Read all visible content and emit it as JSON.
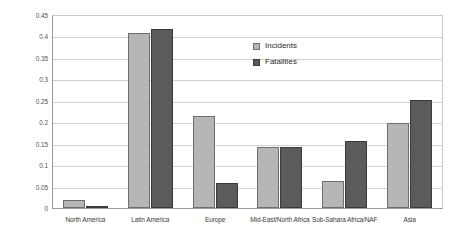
{
  "chart_data": {
    "type": "bar",
    "title": "",
    "subtitle": "",
    "xlabel": "",
    "ylabel": "",
    "ylim": [
      0,
      0.45
    ],
    "ytick_labels": [
      "0.45",
      "0.4",
      "0.35",
      "0.3",
      "0.25",
      "0.2",
      "0.15",
      "0.1",
      "0.05",
      "0"
    ],
    "ytick_values": [
      0.45,
      0.4,
      0.35,
      0.3,
      0.25,
      0.2,
      0.15,
      0.1,
      0.05,
      0
    ],
    "grid": true,
    "legend_position": "inside-top-center",
    "categories": [
      "North America",
      "Latin America",
      "Europe",
      "Mid-East/North Africa",
      "Sub-Sahara Africa/NAF",
      "Asia"
    ],
    "series": [
      {
        "name": "Incidents",
        "color": "#b6b6b6",
        "values": [
          0.018,
          0.407,
          0.215,
          0.143,
          0.062,
          0.198
        ]
      },
      {
        "name": "Fatalities",
        "color": "#5b5b5b",
        "values": [
          0.005,
          0.418,
          0.058,
          0.143,
          0.157,
          0.252
        ]
      }
    ]
  },
  "legend": {
    "items": [
      {
        "label": "Incidents",
        "swatch": "incidents"
      },
      {
        "label": "Fatalities",
        "swatch": "fatalities"
      }
    ]
  }
}
